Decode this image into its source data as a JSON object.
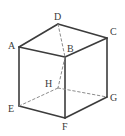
{
  "figure": {
    "kind": "geometry-diagram",
    "background_color": "#ffffff",
    "stroke_color": "#3c3c3c",
    "hidden_stroke_color": "#8c8c8c",
    "label_color": "#3a3a3a",
    "solid_stroke_width": 1.6,
    "hidden_stroke_width": 1.0,
    "hidden_dash_pattern": "2.5,2.5"
  },
  "vertices": [
    {
      "id": "A",
      "label": "A",
      "x": 19,
      "y": 47,
      "label_x": 8,
      "label_y": 41,
      "hidden": false
    },
    {
      "id": "B",
      "label": "B",
      "x": 65,
      "y": 57,
      "label_x": 67,
      "label_y": 44,
      "hidden": false
    },
    {
      "id": "C",
      "label": "C",
      "x": 107,
      "y": 38,
      "label_x": 110,
      "label_y": 27,
      "hidden": false
    },
    {
      "id": "D",
      "label": "D",
      "x": 58,
      "y": 24,
      "label_x": 54,
      "label_y": 12,
      "hidden": false
    },
    {
      "id": "E",
      "label": "E",
      "x": 19,
      "y": 106,
      "label_x": 8,
      "label_y": 104,
      "hidden": false
    },
    {
      "id": "F",
      "label": "F",
      "x": 65,
      "y": 118,
      "label_x": 62,
      "label_y": 122,
      "hidden": false
    },
    {
      "id": "G",
      "label": "G",
      "x": 107,
      "y": 97,
      "label_x": 110,
      "label_y": 93,
      "hidden": false
    },
    {
      "id": "H",
      "label": "H",
      "x": 58,
      "y": 88,
      "label_x": 45,
      "label_y": 79,
      "hidden": true
    }
  ],
  "edges": [
    {
      "from": "A",
      "to": "D",
      "hidden": false,
      "name": "edge-a-d"
    },
    {
      "from": "D",
      "to": "C",
      "hidden": false,
      "name": "edge-d-c"
    },
    {
      "from": "A",
      "to": "B",
      "hidden": false,
      "name": "edge-a-b"
    },
    {
      "from": "B",
      "to": "C",
      "hidden": false,
      "name": "edge-b-c"
    },
    {
      "from": "A",
      "to": "E",
      "hidden": false,
      "name": "edge-a-e"
    },
    {
      "from": "C",
      "to": "G",
      "hidden": false,
      "name": "edge-c-g"
    },
    {
      "from": "B",
      "to": "F",
      "hidden": false,
      "name": "edge-b-f"
    },
    {
      "from": "E",
      "to": "F",
      "hidden": false,
      "name": "edge-e-f"
    },
    {
      "from": "F",
      "to": "G",
      "hidden": false,
      "name": "edge-f-g"
    },
    {
      "from": "D",
      "to": "B",
      "hidden": true,
      "name": "edge-d-b-hidden"
    },
    {
      "from": "B",
      "to": "H",
      "hidden": true,
      "name": "edge-b-h-hidden"
    },
    {
      "from": "E",
      "to": "H",
      "hidden": true,
      "name": "edge-e-h-hidden"
    },
    {
      "from": "H",
      "to": "G",
      "hidden": true,
      "name": "edge-h-g-hidden"
    }
  ]
}
